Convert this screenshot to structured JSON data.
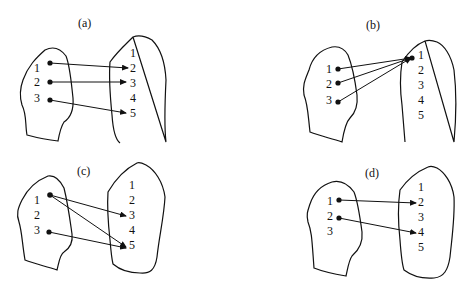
{
  "panels": [
    {
      "label": "(a)",
      "domain": [
        "1",
        "2",
        "3"
      ],
      "codomain": [
        "1",
        "2",
        "3",
        "4",
        "5"
      ],
      "mapping": [
        [
          "1",
          "2"
        ],
        [
          "2",
          "3"
        ],
        [
          "3",
          "5"
        ]
      ]
    },
    {
      "label": "(b)",
      "domain": [
        "1",
        "2",
        "3"
      ],
      "codomain": [
        "1",
        "2",
        "3",
        "4",
        "5"
      ],
      "mapping": [
        [
          "1",
          "1"
        ],
        [
          "2",
          "1"
        ],
        [
          "3",
          "1"
        ]
      ]
    },
    {
      "label": "(c)",
      "domain": [
        "1",
        "2",
        "3"
      ],
      "codomain": [
        "1",
        "2",
        "3",
        "4",
        "5"
      ],
      "mapping": [
        [
          "1",
          "3"
        ],
        [
          "1",
          "5"
        ],
        [
          "3",
          "5"
        ]
      ]
    },
    {
      "label": "(d)",
      "domain": [
        "1",
        "2",
        "3"
      ],
      "codomain": [
        "1",
        "2",
        "3",
        "4",
        "5"
      ],
      "mapping": [
        [
          "1",
          "2"
        ],
        [
          "2",
          "4"
        ]
      ]
    }
  ]
}
